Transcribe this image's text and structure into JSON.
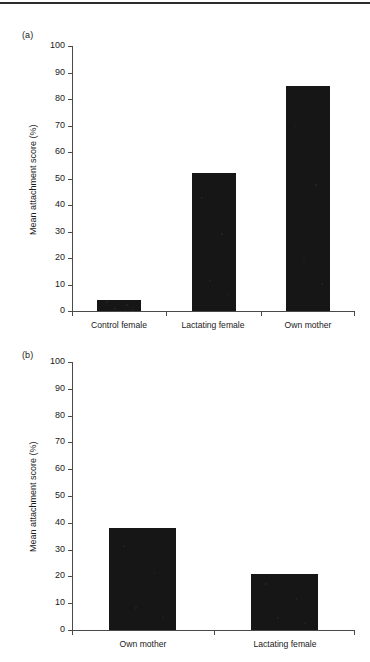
{
  "figure": {
    "has_top_rule": true,
    "ink_color": "#161616",
    "axis_color": "#4a4a4a",
    "text_color": "#1a1a1a"
  },
  "panels": [
    {
      "id": "a",
      "label": "(a)",
      "ylabel": "Mean attachment score (%)",
      "yticks": [
        "100",
        "90",
        "80",
        "70",
        "60",
        "50",
        "40",
        "30",
        "20",
        "10",
        "0"
      ],
      "categories": [
        "Control female",
        "Lactating female",
        "Own mother"
      ],
      "values": [
        4,
        52,
        85
      ]
    },
    {
      "id": "b",
      "label": "(b)",
      "ylabel": "Mean attachment score (%)",
      "yticks": [
        "100",
        "90",
        "80",
        "70",
        "60",
        "50",
        "40",
        "30",
        "20",
        "10",
        "0"
      ],
      "categories": [
        "Own mother",
        "Lactating female"
      ],
      "values": [
        38,
        21
      ]
    }
  ],
  "chart_data": [
    {
      "type": "bar",
      "panel": "(a)",
      "title": "",
      "xlabel": "",
      "ylabel": "Mean attachment score (%)",
      "categories": [
        "Control female",
        "Lactating female",
        "Own mother"
      ],
      "values": [
        4,
        52,
        85
      ],
      "ylim": [
        0,
        100
      ],
      "ytick_step": 10,
      "grid": false,
      "legend": "none",
      "bar_color": "#161616"
    },
    {
      "type": "bar",
      "panel": "(b)",
      "title": "",
      "xlabel": "",
      "ylabel": "Mean attachment score (%)",
      "categories": [
        "Own mother",
        "Lactating female"
      ],
      "values": [
        38,
        21
      ],
      "ylim": [
        0,
        100
      ],
      "ytick_step": 10,
      "grid": false,
      "legend": "none",
      "bar_color": "#161616"
    }
  ]
}
